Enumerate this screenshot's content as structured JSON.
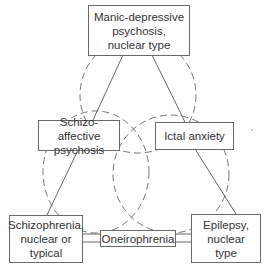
{
  "diagram": {
    "nodes": {
      "top": {
        "lines": [
          "Manic-depressive",
          "psychosis,",
          "nuclear type"
        ]
      },
      "mid_left": {
        "lines": [
          "Schizo-affective",
          "psychosis"
        ]
      },
      "mid_right": {
        "lines": [
          "Ictal anxiety"
        ]
      },
      "bottom_left": {
        "lines": [
          "Schizophrenia,",
          "nuclear or",
          "typical"
        ]
      },
      "bottom_center": {
        "lines": [
          "Oneirophrenia"
        ]
      },
      "bottom_right": {
        "lines": [
          "Epilepsy,",
          "nuclear",
          "type"
        ]
      }
    },
    "colors": {
      "line": "#555555",
      "dashed": "#666666",
      "box_border": "#6a6a6a"
    }
  }
}
